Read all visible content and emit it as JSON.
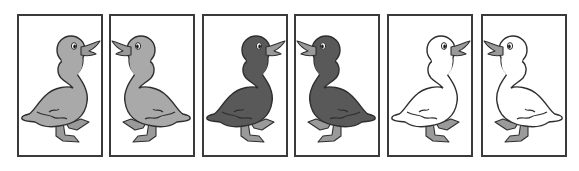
{
  "cards": [
    {
      "left": 17,
      "facing": "right",
      "body_color": "#a9a9a9",
      "label": "gray duckling facing right"
    },
    {
      "left": 109,
      "facing": "left",
      "body_color": "#a9a9a9",
      "label": "gray duckling facing left"
    },
    {
      "left": 202,
      "facing": "right",
      "body_color": "#595959",
      "label": "dark duckling facing right"
    },
    {
      "left": 294,
      "facing": "left",
      "body_color": "#595959",
      "label": "dark duckling facing left"
    },
    {
      "left": 387,
      "facing": "right",
      "body_color": "#ffffff",
      "label": "white duckling facing right"
    },
    {
      "left": 481,
      "facing": "left",
      "body_color": "#ffffff",
      "label": "white duckling facing left"
    }
  ],
  "colors": {
    "outline": "#2e2e2e",
    "beak_feet": "#9a9a9a",
    "frame": "#3a3a3a"
  }
}
